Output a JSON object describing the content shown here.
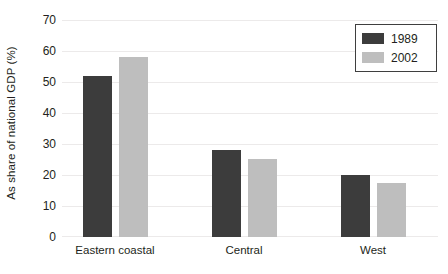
{
  "chart_data": {
    "type": "bar",
    "title": "",
    "xlabel": "",
    "ylabel": "As share of national GDP (%)",
    "categories": [
      "Eastern coastal",
      "Central",
      "West"
    ],
    "series": [
      {
        "name": "1989",
        "color": "#3c3c3c",
        "values": [
          52,
          28,
          20
        ]
      },
      {
        "name": "2002",
        "color": "#bebebe",
        "values": [
          58,
          25,
          17.5
        ]
      }
    ],
    "ylim": [
      0,
      70
    ],
    "ytick_values": [
      0,
      10,
      20,
      30,
      40,
      50,
      60,
      70
    ],
    "ytick_labels": [
      "0",
      "10",
      "20",
      "30",
      "40",
      "50",
      "60",
      "70"
    ],
    "grid": true,
    "legend_position": "top-right"
  },
  "legend": {
    "entries": [
      {
        "label": "1989",
        "swatch_name": "legend-swatch-1989"
      },
      {
        "label": "2002",
        "swatch_name": "legend-swatch-2002"
      }
    ]
  },
  "colors": {
    "series_1989": "#3c3c3c",
    "series_2002": "#bebebe",
    "gridline": "#eceaea",
    "text": "#231f20",
    "background": "#ffffff",
    "legend_border": "#3f3f3f"
  }
}
